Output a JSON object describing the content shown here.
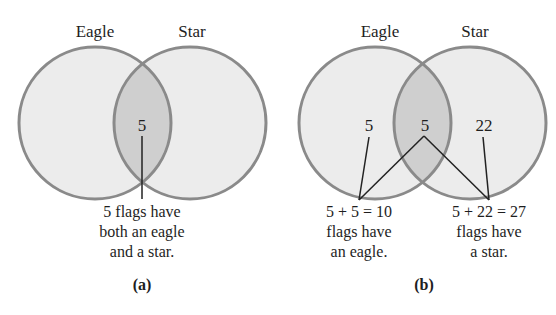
{
  "colors": {
    "circle_fill": "#ececec",
    "overlap_fill": "#cfcfcf",
    "circle_stroke": "#8a8a8a",
    "line": "#222222",
    "text": "#1e1e1e"
  },
  "panel_a": {
    "set_labels": {
      "left": "Eagle",
      "right": "Star"
    },
    "regions": {
      "intersection": "5"
    },
    "caption_lines": [
      "5 flags have",
      "both an eagle",
      "and a star."
    ],
    "panel_label": "(a)"
  },
  "panel_b": {
    "set_labels": {
      "left": "Eagle",
      "right": "Star"
    },
    "regions": {
      "eagle_only": "5",
      "intersection": "5",
      "star_only": "22"
    },
    "eagle_caption_lines": [
      "5 + 5 = 10",
      "flags have",
      "an eagle."
    ],
    "star_caption_lines": [
      "5 + 22 = 27",
      "flags have",
      "a star."
    ],
    "panel_label": "(b)"
  }
}
